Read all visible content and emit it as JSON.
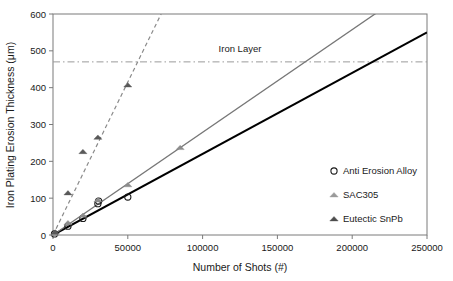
{
  "chart_data": {
    "type": "scatter",
    "title": "",
    "xlabel": "Number of Shots (#)",
    "ylabel": "Iron Plating Erosion Thickness (μm)",
    "xlim": [
      0,
      250000
    ],
    "ylim": [
      0,
      600
    ],
    "xticks": [
      0,
      50000,
      100000,
      150000,
      200000,
      250000
    ],
    "yticks": [
      0,
      100,
      200,
      300,
      400,
      500,
      600
    ],
    "xtick_labels": [
      "0",
      "50000",
      "100000",
      "150000",
      "200000",
      "250000"
    ],
    "ytick_labels": [
      "0",
      "100",
      "200",
      "300",
      "400",
      "500",
      "600"
    ],
    "grid": false,
    "legend_position": "right-inside",
    "annotations": [
      {
        "name": "iron-layer",
        "text": "Iron Layer",
        "type": "hline",
        "y": 470,
        "style": "dash-dot",
        "color": "#9a9a9a",
        "label_x": 125000,
        "label_y": 498
      }
    ],
    "series": [
      {
        "name": "Anti Erosion Alloy",
        "marker": "open-circle",
        "color": "#1a1a1a",
        "line_style": "solid",
        "line_color": "#000000",
        "fit_slope": 0.0022,
        "fit_x": [
          0,
          250000
        ],
        "fit_y": [
          0,
          550
        ],
        "points": [
          {
            "x": 1000,
            "y": 3
          },
          {
            "x": 10000,
            "y": 24
          },
          {
            "x": 20000,
            "y": 45
          },
          {
            "x": 30000,
            "y": 85
          },
          {
            "x": 30500,
            "y": 92
          },
          {
            "x": 50000,
            "y": 103
          }
        ]
      },
      {
        "name": "SAC305",
        "marker": "triangle-light",
        "color": "#8c8c8c",
        "line_style": "solid",
        "line_color": "#777777",
        "fit_slope": 0.00279,
        "fit_x": [
          0,
          250000
        ],
        "fit_y": [
          0,
          697
        ],
        "points": [
          {
            "x": 1000,
            "y": 4
          },
          {
            "x": 10000,
            "y": 33
          },
          {
            "x": 20000,
            "y": 53
          },
          {
            "x": 30000,
            "y": 95
          },
          {
            "x": 50000,
            "y": 136
          },
          {
            "x": 85000,
            "y": 237
          }
        ]
      },
      {
        "name": "Eutectic SnPb",
        "marker": "triangle-dark",
        "color": "#595959",
        "line_style": "dashed",
        "line_color": "#8a8a8a",
        "fit_slope": 0.0083,
        "fit_x": [
          0,
          72500
        ],
        "fit_y": [
          0,
          602
        ],
        "points": [
          {
            "x": 1500,
            "y": 8
          },
          {
            "x": 10000,
            "y": 114
          },
          {
            "x": 20000,
            "y": 226
          },
          {
            "x": 30000,
            "y": 265
          },
          {
            "x": 50000,
            "y": 407
          }
        ]
      }
    ],
    "legend": [
      {
        "label": "Anti Erosion Alloy",
        "marker": "open-circle",
        "color": "#1a1a1a"
      },
      {
        "label": "SAC305",
        "marker": "triangle-light",
        "color": "#9a9a9a"
      },
      {
        "label": "Eutectic SnPb",
        "marker": "triangle-dark",
        "color": "#4d4d4d"
      }
    ]
  }
}
